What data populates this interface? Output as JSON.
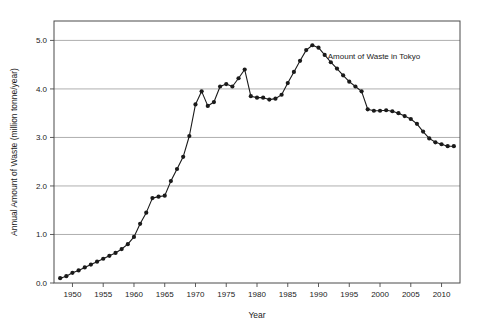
{
  "chart_data": {
    "type": "line",
    "title": "",
    "xlabel": "Year",
    "ylabel": "Annual Amount of Waste (million tonne/year)",
    "xlim": [
      1947,
      2013
    ],
    "ylim": [
      0.0,
      5.4
    ],
    "xticks": [
      1950,
      1955,
      1960,
      1965,
      1970,
      1975,
      1980,
      1985,
      1990,
      1995,
      2000,
      2005,
      2010
    ],
    "xtick_labels": [
      "1950",
      "1955",
      "1960",
      "1965",
      "1970",
      "1975",
      "1980",
      "1985",
      "1990",
      "1995",
      "2000",
      "2005",
      "2010"
    ],
    "yticks": [
      0.0,
      1.0,
      2.0,
      3.0,
      4.0,
      5.0
    ],
    "ytick_labels": [
      "0.0",
      "1.0",
      "2.0",
      "3.0",
      "4.0",
      "5.0"
    ],
    "grid": "horizontal",
    "legend_position": "inline-annotation",
    "marker": "filled-circle",
    "line_color": "#1a1a1a",
    "marker_color": "#1a1a1a",
    "annotations": [
      {
        "text": "Amount of Waste in Tokyo",
        "x": 1991.5,
        "y": 4.62
      }
    ],
    "series": [
      {
        "name": "Amount of Waste in Tokyo",
        "x": [
          1948,
          1949,
          1950,
          1951,
          1952,
          1953,
          1954,
          1955,
          1956,
          1957,
          1958,
          1959,
          1960,
          1961,
          1962,
          1963,
          1964,
          1965,
          1966,
          1967,
          1968,
          1969,
          1970,
          1971,
          1972,
          1973,
          1974,
          1975,
          1976,
          1977,
          1978,
          1979,
          1980,
          1981,
          1982,
          1983,
          1984,
          1985,
          1986,
          1987,
          1988,
          1989,
          1990,
          1991,
          1992,
          1993,
          1994,
          1995,
          1996,
          1997,
          1998,
          1999,
          2000,
          2001,
          2002,
          2003,
          2004,
          2005,
          2006,
          2007,
          2008,
          2009,
          2010,
          2011,
          2012
        ],
        "values": [
          0.1,
          0.14,
          0.21,
          0.26,
          0.32,
          0.38,
          0.44,
          0.5,
          0.56,
          0.62,
          0.7,
          0.8,
          0.95,
          1.22,
          1.45,
          1.75,
          1.78,
          1.8,
          2.1,
          2.35,
          2.6,
          3.03,
          3.68,
          3.95,
          3.65,
          3.73,
          4.05,
          4.1,
          4.05,
          4.22,
          4.4,
          3.85,
          3.82,
          3.82,
          3.78,
          3.8,
          3.88,
          4.12,
          4.35,
          4.58,
          4.8,
          4.9,
          4.85,
          4.7,
          4.55,
          4.42,
          4.28,
          4.15,
          4.05,
          3.95,
          3.58,
          3.55,
          3.55,
          3.56,
          3.54,
          3.5,
          3.44,
          3.38,
          3.28,
          3.12,
          2.98,
          2.9,
          2.86,
          2.82,
          2.82
        ]
      }
    ]
  }
}
